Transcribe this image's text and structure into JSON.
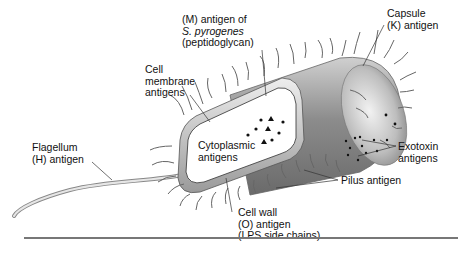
{
  "diagram": {
    "labels": {
      "m_antigen": {
        "line1": "(M) antigen of",
        "line2": "S. pyrogenes",
        "line3": "(peptidoglycan)"
      },
      "capsule": {
        "line1": "Capsule",
        "line2": "(K) antigen"
      },
      "cell_membrane": {
        "line1": "Cell",
        "line2": "membrane",
        "line3": "antigens"
      },
      "flagellum": {
        "line1": "Flagellum",
        "line2": "(H) antigen"
      },
      "cytoplasmic": {
        "line1": "Cytoplasmic",
        "line2": "antigens"
      },
      "exotoxin": {
        "line1": "Exotoxin",
        "line2": "antigens"
      },
      "pilus": {
        "line1": "Pilus antigen"
      },
      "cell_wall": {
        "line1": "Cell wall",
        "line2": "(O) antigen",
        "line3": "(LPS side chains)"
      }
    },
    "colors": {
      "capsule_dark": "#8a8a8a",
      "capsule_light": "#d8d8d8",
      "cell_interior": "#ffffff",
      "outline": "#555555",
      "text": "#111111",
      "rule": "#777777"
    }
  }
}
